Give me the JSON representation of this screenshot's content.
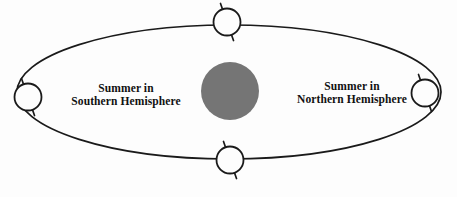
{
  "diagram": {
    "background_color": "#fdfdfd",
    "stroke_color": "#1a1a1a",
    "sun": {
      "name": "sun",
      "fill_color": "#757575",
      "center_x": 230,
      "center_y": 91,
      "radius": 29
    },
    "orbit": {
      "name": "elliptical-orbit",
      "center_x": 229,
      "center_y": 92,
      "radius_x": 212,
      "radius_y": 67,
      "stroke_width": 1.6
    },
    "earth_positions": [
      {
        "name": "earth-top",
        "center_x": 227,
        "center_y": 22,
        "radius": 13.5,
        "axis_tilt_degrees": 23.5
      },
      {
        "name": "earth-left",
        "center_x": 28,
        "center_y": 97,
        "radius": 13.5,
        "axis_tilt_degrees": 23.5
      },
      {
        "name": "earth-bottom",
        "center_x": 230,
        "center_y": 160,
        "radius": 13.5,
        "axis_tilt_degrees": 23.5
      },
      {
        "name": "earth-right",
        "center_x": 425,
        "center_y": 93,
        "radius": 13.5,
        "axis_tilt_degrees": 23.5
      }
    ],
    "labels": {
      "southern": {
        "line1": "Summer in",
        "line2": "Southern Hemisphere"
      },
      "northern": {
        "line1": "Summer in",
        "line2": "Northern Hemisphere"
      }
    }
  }
}
